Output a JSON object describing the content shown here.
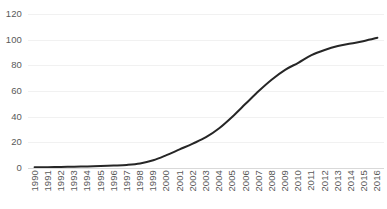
{
  "chart_data": {
    "type": "line",
    "title": "",
    "subtitle": "",
    "xlabel": "",
    "ylabel": "",
    "categories": [
      "1990",
      "1991",
      "1992",
      "1993",
      "1994",
      "1995",
      "1996",
      "1997",
      "1998",
      "1999",
      "2000",
      "2001",
      "2002",
      "2003",
      "2004",
      "2005",
      "2006",
      "2007",
      "2008",
      "2009",
      "2010",
      "2011",
      "2012",
      "2013",
      "2014",
      "2015",
      "2016"
    ],
    "values": [
      0.5,
      0.6,
      0.8,
      1.0,
      1.2,
      1.5,
      1.9,
      2.4,
      3.5,
      6.0,
      10.0,
      14.5,
      19.0,
      24.0,
      31.0,
      40.0,
      50.0,
      60.0,
      69.0,
      76.5,
      82.0,
      88.0,
      92.0,
      95.0,
      97.0,
      99.0,
      101.5
    ],
    "series": [
      {
        "name": "",
        "values": [
          0.5,
          0.6,
          0.8,
          1.0,
          1.2,
          1.5,
          1.9,
          2.4,
          3.5,
          6.0,
          10.0,
          14.5,
          19.0,
          24.0,
          31.0,
          40.0,
          50.0,
          60.0,
          69.0,
          76.5,
          82.0,
          88.0,
          92.0,
          95.0,
          97.0,
          99.0,
          101.5
        ],
        "color": "#262626"
      }
    ],
    "ylim": [
      0,
      120
    ],
    "yticks": [
      0,
      20,
      40,
      60,
      80,
      100,
      120
    ],
    "ytick_labels": [
      "0",
      "20",
      "40",
      "60",
      "80",
      "100",
      "120"
    ],
    "grid": true,
    "grid_axis": "y",
    "legend": false,
    "legend_position": "none",
    "line_width": 2,
    "markers": false,
    "smooth": true
  },
  "colors": {
    "line": "#262626",
    "grid": "#f1f1f1",
    "axis": "#d9d9d9",
    "tick_text": "#595959",
    "background": "#ffffff"
  }
}
